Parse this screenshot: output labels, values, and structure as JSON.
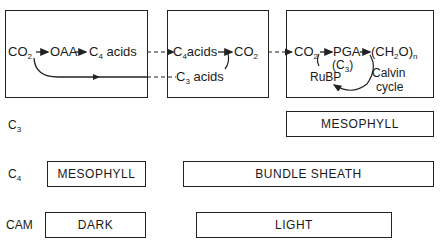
{
  "diagram": {
    "box1": {
      "co2": "CO",
      "co2_sub": "2",
      "oaa": "OAA",
      "c4": "C",
      "c4_sub": "4",
      "c4_rest": " acids"
    },
    "box2": {
      "c4": "C",
      "c4_sub": "4",
      "c4_rest": "acids",
      "co2": "CO",
      "co2_sub": "2",
      "c3": "C",
      "c3_sub": "3",
      "c3_rest": " acids"
    },
    "box3": {
      "co2": "CO",
      "co2_sub": "2",
      "pga": "PGA",
      "c3_paren": "(C",
      "c3_sub": "3",
      "c3_close": ")",
      "ch2o_open": "(CH",
      "ch2o_sub": "2",
      "ch2o_close": "O)",
      "ch2o_n": "n",
      "rubp": "RuBP",
      "calvin": "Calvin",
      "cycle": "cycle"
    }
  },
  "rows": [
    {
      "label": "C",
      "label_sub": "3",
      "segments": [
        {
          "text": "MESOPHYLL"
        }
      ]
    },
    {
      "label": "C",
      "label_sub": "4",
      "segments": [
        {
          "text": "MESOPHYLL"
        },
        {
          "text": "BUNDLE SHEATH"
        }
      ]
    },
    {
      "label": "CAM",
      "segments": [
        {
          "text": "DARK"
        },
        {
          "text": "LIGHT"
        }
      ]
    }
  ]
}
